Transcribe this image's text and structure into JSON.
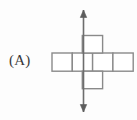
{
  "figure": {
    "label": "(A)",
    "kind": "cube-net-with-rotation-axis",
    "colors": {
      "background": "#fdfdfd",
      "net_stroke": "#8a8a8a",
      "net_fill": "#ffffff",
      "axis_stroke": "#6d6d6d",
      "axis_head": "#5d5d5d",
      "label_text": "#3a3a3a"
    },
    "net": {
      "cell_width": 20.3,
      "cell_height": 18.2,
      "row_cells": 4,
      "column_cells": 3,
      "cells": [
        {
          "name": "row-cell-1",
          "x": 52.0,
          "y": 53.0,
          "w": 20.3,
          "h": 18.2
        },
        {
          "name": "row-cell-2",
          "x": 72.3,
          "y": 53.0,
          "w": 20.3,
          "h": 18.2
        },
        {
          "name": "row-cell-3",
          "x": 92.6,
          "y": 53.0,
          "w": 20.3,
          "h": 18.2
        },
        {
          "name": "row-cell-4",
          "x": 112.9,
          "y": 53.0,
          "w": 20.3,
          "h": 18.2
        },
        {
          "name": "column-cell-top",
          "x": 82.3,
          "y": 35.5,
          "w": 20.3,
          "h": 17.5
        },
        {
          "name": "column-cell-bottom",
          "x": 82.3,
          "y": 71.2,
          "w": 20.3,
          "h": 17.5
        }
      ]
    },
    "axis": {
      "orientation": "vertical",
      "x": 83.5,
      "y_top": 10.0,
      "y_bottom": 112.0,
      "arrowheads": "both",
      "head_half_width": 3.2,
      "head_length": 7.5
    }
  }
}
